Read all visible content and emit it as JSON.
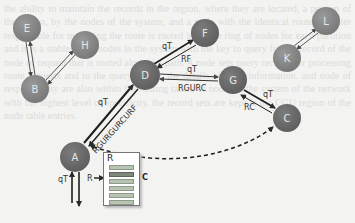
{
  "background_text": "the ability to maintain the records in the region, where they are located, a portion of the region, by the nodes of the system, and a node with the identical route a cluster responsible for managing the route is rooted in A: the ring of nodes for each partition and it is a stable set of nodes in the system with the key to query for the record of the node of request that is routed along the path. A node sets query records for processing route requests and to the query region. the details of route information. and node of responsibility are also within the routing tables of nodes in the system of the network with the highest level of specificity. the record sets are kept in the CGU region of the node table entries.",
  "nodes": [
    {
      "id": "E",
      "label": "E",
      "x": 27,
      "y": 28
    },
    {
      "id": "H",
      "label": "H",
      "x": 85,
      "y": 45
    },
    {
      "id": "B",
      "label": "B",
      "x": 35,
      "y": 89
    },
    {
      "id": "D",
      "label": "D",
      "x": 145,
      "y": 75
    },
    {
      "id": "F",
      "label": "F",
      "x": 205,
      "y": 33
    },
    {
      "id": "G",
      "label": "G",
      "x": 233,
      "y": 80
    },
    {
      "id": "C",
      "label": "C",
      "x": 287,
      "y": 118
    },
    {
      "id": "K",
      "label": "K",
      "x": 287,
      "y": 58
    },
    {
      "id": "L",
      "label": "L",
      "x": 326,
      "y": 21
    },
    {
      "id": "A",
      "label": "A",
      "x": 75,
      "y": 157
    }
  ],
  "edge_labels": {
    "a_d_query": "qT",
    "a_d_response": "RGURGURCURF",
    "d_f_query": "qT",
    "d_f_response": "RF",
    "d_g_query": "qT",
    "d_g_response": "RGURC",
    "g_c_query": "qT",
    "g_c_response": "RC",
    "a_in_query": "qT",
    "a_out_response": "R"
  },
  "table": {
    "title": "R",
    "rows": 6,
    "selected_row": 1,
    "selected_label": "C"
  },
  "colors": {
    "node_fill": "#8a8a8a",
    "node_fill_dark": "#6f6f6f",
    "edge": "#2a2a2a",
    "background": "#f3f3f1"
  }
}
